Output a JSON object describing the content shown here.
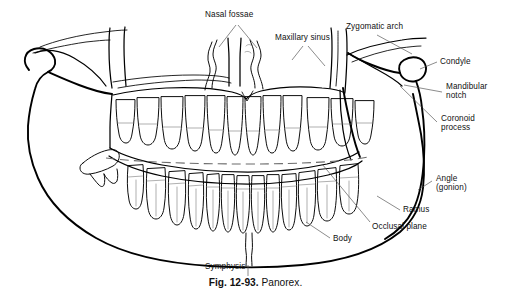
{
  "figure": {
    "caption_number": "Fig. 12-93.",
    "caption_title": "Panorex.",
    "type": "anatomical-line-drawing"
  },
  "labels": {
    "nasal_fossae": "Nasal fossae",
    "maxillary_sinus": "Maxillary sinus",
    "zygomatic_arch": "Zygomatic arch",
    "condyle": "Condyle",
    "mandibular_notch_line1": "Mandibular",
    "mandibular_notch_line2": "notch",
    "coronoid_process_line1": "Coronoid",
    "coronoid_process_line2": "process",
    "angle_line1": "Angle",
    "angle_line2": "(gonion)",
    "ramus": "Ramus",
    "occlusal_plane": "Occlusal plane",
    "body": "Body",
    "symphysis": "Symphysis"
  },
  "colors": {
    "background": "#ffffff",
    "ink": "#000000",
    "leader_line": "#4d4d4d",
    "occlusal_dash": "#6b6b6b",
    "faint_detail": "#7a7a7a"
  }
}
